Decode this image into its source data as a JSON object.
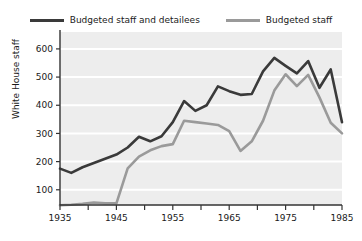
{
  "chart_data": {
    "type": "line",
    "title": "",
    "xlabel": "",
    "ylabel": "White House staff",
    "xlim": [
      1935,
      1985
    ],
    "ylim": [
      46,
      660
    ],
    "grid": true,
    "legend_position": "top-center",
    "ytick_values": [
      100,
      200,
      300,
      400,
      500,
      600
    ],
    "ytick_labels": [
      "100",
      "200",
      "300",
      "400",
      "500",
      "600"
    ],
    "xtick_values": [
      1935,
      1940,
      1945,
      1950,
      1955,
      1960,
      1965,
      1970,
      1975,
      1980,
      1985
    ],
    "xtick_labels": [
      "1935",
      "",
      "1945",
      "",
      "1955",
      "",
      "1965",
      "",
      "1975",
      "",
      "1985"
    ],
    "xtick_major_labels": [
      "1935",
      "1945",
      "1955",
      "1965",
      "1975",
      "1985"
    ],
    "plot_background": "#ededed",
    "gridline_color": "#ffffff",
    "x": [
      1935,
      1937,
      1939,
      1941,
      1943,
      1945,
      1947,
      1949,
      1951,
      1953,
      1955,
      1957,
      1959,
      1961,
      1963,
      1965,
      1967,
      1969,
      1971,
      1973,
      1975,
      1977,
      1979,
      1981,
      1983,
      1985
    ],
    "series": [
      {
        "name": "Budgeted staff and detailees",
        "color": "#3a3a3a",
        "values": [
          175,
          160,
          180,
          195,
          210,
          225,
          250,
          288,
          272,
          290,
          340,
          415,
          380,
          400,
          467,
          450,
          437,
          440,
          520,
          568,
          540,
          513,
          557,
          462,
          527,
          340
        ]
      },
      {
        "name": "Budgeted staff",
        "color": "#9a9a9a",
        "values": [
          45,
          47,
          50,
          55,
          52,
          52,
          176,
          218,
          240,
          255,
          262,
          345,
          340,
          335,
          330,
          308,
          238,
          272,
          345,
          452,
          510,
          468,
          508,
          428,
          338,
          300
        ]
      }
    ]
  },
  "legend": {
    "entries": [
      {
        "label": "Budgeted staff and detailees",
        "color": "#3a3a3a"
      },
      {
        "label": "Budgeted staff",
        "color": "#9a9a9a"
      }
    ]
  },
  "axes": {
    "y_axis_title": "White House staff"
  }
}
